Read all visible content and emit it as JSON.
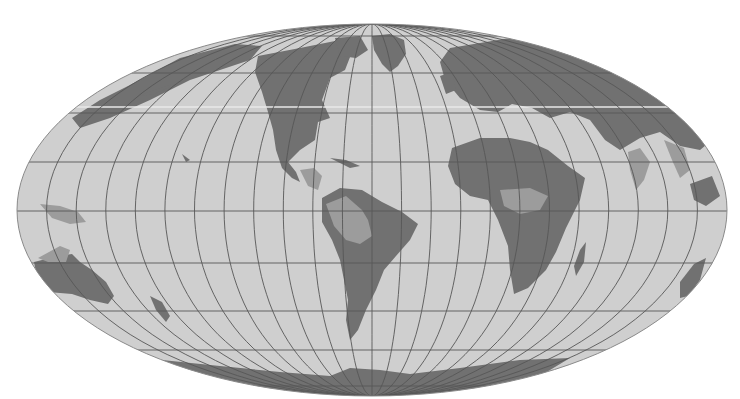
{
  "map": {
    "projection": "Mollweide",
    "width": 740,
    "height": 399,
    "center": [
      372,
      210
    ],
    "radii": [
      355,
      186
    ],
    "colors": {
      "background": "#ffffff",
      "ocean": "#cfcfcf",
      "land_high": "#717171",
      "land_low": "#9c9c9c",
      "graticule": "#575757",
      "outline": "#8a8a8a",
      "highlight_stripe": "#e8e8e8"
    },
    "graticule": {
      "meridian_step_deg": 15,
      "parallel_y": [
        36,
        73,
        113,
        162,
        211,
        263,
        311,
        350,
        386
      ]
    },
    "land_high": [
      {
        "name": "north-america",
        "d": "M258 56 L300 48 L340 40 L352 52 L345 70 L330 78 L322 100 L330 118 L318 122 L315 140 L300 150 L288 162 L296 172 L300 182 L292 178 L282 168 L276 150 L273 130 L268 112 L262 92 L255 72 Z"
      },
      {
        "name": "alaska-asia-strip",
        "d": "M130 85 L180 58 L235 44 L262 46 L250 60 L220 70 L190 80 L150 100 L110 118 L80 128 L72 118 L100 100 Z"
      },
      {
        "name": "greenland",
        "d": "M372 36 L390 34 L404 40 L406 54 L398 66 L390 72 L382 64 L374 50 Z"
      },
      {
        "name": "arctic-islands",
        "d": "M335 38 L360 36 L368 50 L356 58 L340 56 Z"
      },
      {
        "name": "south-america",
        "d": "M322 198 L340 188 L362 190 L382 202 L402 212 L418 224 L410 240 L396 256 L384 270 L376 290 L366 310 L358 330 L350 340 L346 320 L348 300 L344 280 L340 260 L332 240 L322 222 Z"
      },
      {
        "name": "eurasia",
        "d": "M450 48 L510 38 L560 46 L620 64 L670 88 L700 112 L712 140 L700 150 L680 146 L660 132 L640 138 L620 150 L605 140 L590 120 L570 112 L550 118 L532 108 L512 104 L498 112 L480 110 L460 98 L445 80 L440 62 Z"
      },
      {
        "name": "africa",
        "d": "M452 148 L480 138 L510 138 L530 142 L548 150 L568 166 L585 178 L580 200 L566 228 L556 252 L546 270 L528 288 L514 294 L510 270 L508 246 L498 220 L488 200 L470 196 L455 184 L448 166 Z"
      },
      {
        "name": "madagascar",
        "d": "M580 250 L586 242 L584 262 L576 276 L574 266 Z"
      },
      {
        "name": "australia",
        "d": "M34 262 L58 256 L72 254 L80 262 L92 270 L106 282 L114 296 L108 304 L90 300 L72 294 L48 292 L38 282 Z"
      },
      {
        "name": "australia-east",
        "d": "M680 282 L694 264 L706 258 L700 280 L688 296 L680 298 Z"
      },
      {
        "name": "new-zealand",
        "d": "M150 296 L162 302 L170 316 L166 322 L156 310 Z"
      },
      {
        "name": "antarctica",
        "d": "M162 360 L220 366 L280 372 L330 376 L350 368 L380 370 L410 374 L460 368 L520 360 L570 358 L540 376 L470 390 L400 395 L340 395 L270 390 L210 378 Z"
      },
      {
        "name": "se-asia-islands",
        "d": "M690 184 L712 176 L720 196 L706 206 L694 200 Z"
      }
    ],
    "land_low": [
      {
        "name": "amazon-lowlands",
        "d": "M326 204 L346 196 L362 210 L368 220 L372 236 L360 244 L346 240 L334 226 Z"
      },
      {
        "name": "central-america",
        "d": "M300 170 L314 168 L322 176 L318 190 L308 186 Z"
      },
      {
        "name": "sahel-congo",
        "d": "M500 190 L530 188 L548 196 L540 210 L520 214 L504 206 Z"
      },
      {
        "name": "india",
        "d": "M628 152 L640 148 L650 162 L644 180 L636 190 L630 170 Z"
      },
      {
        "name": "indochina",
        "d": "M664 140 L684 148 L690 170 L680 178 L672 160 Z"
      },
      {
        "name": "new-guinea",
        "d": "M40 204 L60 206 L78 212 L86 222 L70 224 L52 218 Z"
      },
      {
        "name": "australia-north",
        "d": "M38 258 L60 246 L70 250 L66 262 L48 262 Z"
      }
    ],
    "islands": [
      {
        "name": "aleutians",
        "d": "M140 96 L148 92 L160 88 L172 84 L168 88 L154 94 Z"
      },
      {
        "name": "hawaii",
        "d": "M182 154 L190 160 L186 162 Z"
      },
      {
        "name": "japan",
        "d": "M76 118 L90 108 L96 112 L84 124 Z"
      },
      {
        "name": "caribbean",
        "d": "M330 158 L346 160 L360 166 L350 168 Z"
      },
      {
        "name": "british-isles",
        "d": "M440 76 L452 72 L456 90 L446 94 Z"
      }
    ]
  }
}
